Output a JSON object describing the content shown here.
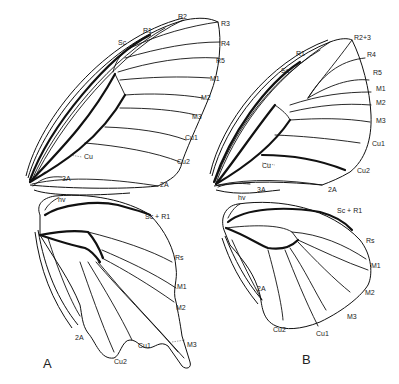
{
  "figure": {
    "panels": [
      {
        "id": "A",
        "letter": "A",
        "forewing": {
          "labels": {
            "sc": "Sc",
            "r1": "R1",
            "r2": "R2",
            "r3": "R3",
            "r4": "R4",
            "r5": "R5",
            "m1": "M1",
            "m2": "M2",
            "m3": "M3",
            "cu1": "Cu1",
            "cu2": "Cu2",
            "cu": "Cu",
            "a2": "2A",
            "a3": "3A"
          }
        },
        "hindwing": {
          "labels": {
            "hv": "hv",
            "scr1": "Sc + R1",
            "rs": "Rs",
            "m1": "M1",
            "m2": "M2",
            "m3": "M3",
            "cu1": "Cu1",
            "cu2": "Cu2",
            "a2": "2A"
          }
        }
      },
      {
        "id": "B",
        "letter": "B",
        "forewing": {
          "labels": {
            "sc": "Sc",
            "r1": "R1",
            "r23": "R2+3",
            "r4": "R4",
            "r5": "R5",
            "m1": "M1",
            "m2": "M2",
            "m3": "M3",
            "cu1": "Cu1",
            "cu2": "Cu2",
            "cu": "Cu",
            "a2": "2A",
            "a3": "3A"
          }
        },
        "hindwing": {
          "labels": {
            "hv": "hv",
            "scr1": "Sc + R1",
            "rs": "Rs",
            "m1": "M1",
            "m2": "M2",
            "m3": "M3",
            "cu1": "Cu1",
            "cu2": "Cu2",
            "a2": "2A"
          }
        }
      }
    ]
  }
}
